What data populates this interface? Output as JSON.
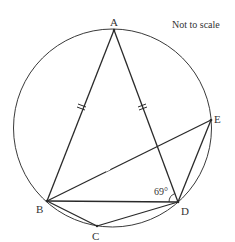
{
  "diagram": {
    "note": "Not to scale",
    "angle_label": "69°",
    "colors": {
      "stroke": "#2a2a2a",
      "circle": "#3a3a3a",
      "text": "#333333"
    },
    "circle": {
      "cx": 112.5,
      "cy": 128,
      "r": 99
    },
    "points": {
      "A": {
        "label": "A",
        "x": 114,
        "y": 30
      },
      "B": {
        "label": "B",
        "x": 47,
        "y": 201
      },
      "C": {
        "label": "C",
        "x": 97,
        "y": 226
      },
      "D": {
        "label": "D",
        "x": 178,
        "y": 202
      },
      "E": {
        "label": "E",
        "x": 211,
        "y": 120
      }
    },
    "segments": [
      "AB",
      "AD",
      "BD",
      "BC",
      "CD",
      "BE",
      "DE"
    ],
    "equal_marks": [
      "AB",
      "AD"
    ],
    "angle": {
      "at": "D",
      "between": [
        "B",
        "A"
      ],
      "value": "69°"
    }
  }
}
